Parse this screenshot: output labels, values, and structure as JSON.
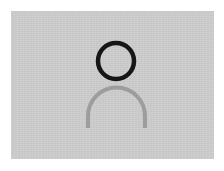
{
  "image": {
    "width": 224,
    "height": 171,
    "outer_background_color": "#ffffff"
  },
  "canvas": {
    "label": "avatar placeholder canvas",
    "background_color": "#cdcdcd",
    "x": 11,
    "y": 11,
    "width": 203,
    "height": 148
  },
  "avatar": {
    "icon_name": "user-avatar-placeholder-icon",
    "alt_text": "User avatar placeholder",
    "head": {
      "shape": "circle-outline",
      "stroke_color": "#161616",
      "fill_color": "none",
      "center_x": 116,
      "center_y": 61,
      "radius": 18,
      "stroke_width": 4.5
    },
    "shoulders": {
      "shape": "arc-open-bottom",
      "stroke_color": "#9d9d9d",
      "fill_color": "none",
      "center_x": 116.5,
      "center_y": 116,
      "radius": 28.5,
      "stroke_width": 4,
      "start_angle_deg": 180,
      "end_angle_deg": 360,
      "leg_bottom_y": 128
    }
  }
}
